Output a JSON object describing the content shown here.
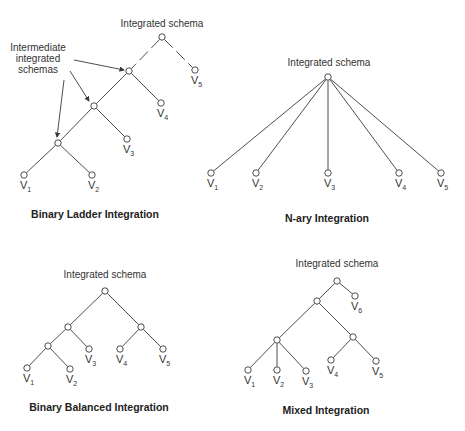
{
  "panels": [
    {
      "id": "binary-ladder",
      "title": "Binary Ladder Integration",
      "root_label": "Integrated schema",
      "annotation": [
        "Intermediate",
        "integrated",
        "schemas"
      ],
      "root_label_pos": [
        162,
        27
      ],
      "title_pos": [
        95,
        218
      ],
      "nodes": [
        {
          "id": "r",
          "x": 162,
          "y": 37
        },
        {
          "id": "i3",
          "x": 129,
          "y": 71
        },
        {
          "id": "i2",
          "x": 94,
          "y": 106
        },
        {
          "id": "i1",
          "x": 58,
          "y": 143
        },
        {
          "id": "v1",
          "x": 24,
          "y": 175,
          "label": "V",
          "sub": "1"
        },
        {
          "id": "v2",
          "x": 92,
          "y": 175,
          "label": "V",
          "sub": "2"
        },
        {
          "id": "v3",
          "x": 127,
          "y": 139,
          "label": "V",
          "sub": "3"
        },
        {
          "id": "v4",
          "x": 161,
          "y": 103,
          "label": "V",
          "sub": "4"
        },
        {
          "id": "v5",
          "x": 195,
          "y": 70,
          "label": "V",
          "sub": "5"
        }
      ],
      "edges": [
        [
          "r",
          "i3"
        ],
        [
          "r",
          "v5"
        ],
        [
          "i3",
          "i2"
        ],
        [
          "i3",
          "v4"
        ],
        [
          "i2",
          "i1"
        ],
        [
          "i2",
          "v3"
        ],
        [
          "i1",
          "v1"
        ],
        [
          "i1",
          "v2"
        ]
      ],
      "dashed_edges": [
        [
          "r",
          "i3"
        ],
        [
          "r",
          "v5"
        ]
      ],
      "arrows": [
        {
          "from": [
            74,
            60
          ],
          "to": [
            124,
            70
          ]
        },
        {
          "from": [
            70,
            71
          ],
          "to": [
            89,
            101
          ]
        },
        {
          "from": [
            64,
            80
          ],
          "to": [
            57,
            137
          ]
        }
      ]
    },
    {
      "id": "n-ary",
      "title": "N-ary Integration",
      "root_label": "Integrated schema",
      "root_label_pos": [
        329,
        66
      ],
      "title_pos": [
        327,
        222
      ],
      "nodes": [
        {
          "id": "r",
          "x": 328,
          "y": 77
        },
        {
          "id": "v1",
          "x": 211,
          "y": 173,
          "label": "V",
          "sub": "1"
        },
        {
          "id": "v2",
          "x": 256,
          "y": 173,
          "label": "V",
          "sub": "2"
        },
        {
          "id": "v3",
          "x": 328,
          "y": 173,
          "label": "V",
          "sub": "3"
        },
        {
          "id": "v4",
          "x": 399,
          "y": 173,
          "label": "V",
          "sub": "4"
        },
        {
          "id": "v5",
          "x": 441,
          "y": 173,
          "label": "V",
          "sub": "5"
        }
      ],
      "edges": [
        [
          "r",
          "v1"
        ],
        [
          "r",
          "v2"
        ],
        [
          "r",
          "v3"
        ],
        [
          "r",
          "v4"
        ],
        [
          "r",
          "v5"
        ]
      ]
    },
    {
      "id": "binary-balanced",
      "title": "Binary Balanced Integration",
      "root_label": "Integrated schema",
      "root_label_pos": [
        105,
        278
      ],
      "title_pos": [
        99,
        411
      ],
      "nodes": [
        {
          "id": "r",
          "x": 105,
          "y": 291
        },
        {
          "id": "a",
          "x": 68,
          "y": 327
        },
        {
          "id": "b",
          "x": 141,
          "y": 327
        },
        {
          "id": "c",
          "x": 48,
          "y": 346
        },
        {
          "id": "v1",
          "x": 27,
          "y": 368,
          "label": "V",
          "sub": "1"
        },
        {
          "id": "v2",
          "x": 70,
          "y": 369,
          "label": "V",
          "sub": "2"
        },
        {
          "id": "v3",
          "x": 89,
          "y": 349,
          "label": "V",
          "sub": "3"
        },
        {
          "id": "v4",
          "x": 120,
          "y": 349,
          "label": "V",
          "sub": "4"
        },
        {
          "id": "v5",
          "x": 163,
          "y": 349,
          "label": "V",
          "sub": "5"
        }
      ],
      "edges": [
        [
          "r",
          "a"
        ],
        [
          "r",
          "b"
        ],
        [
          "a",
          "c"
        ],
        [
          "a",
          "v3"
        ],
        [
          "c",
          "v1"
        ],
        [
          "c",
          "v2"
        ],
        [
          "b",
          "v4"
        ],
        [
          "b",
          "v5"
        ]
      ]
    },
    {
      "id": "mixed",
      "title": "Mixed Integration",
      "root_label": "Integrated schema",
      "root_label_pos": [
        337,
        267
      ],
      "title_pos": [
        326,
        414
      ],
      "nodes": [
        {
          "id": "r",
          "x": 337,
          "y": 281
        },
        {
          "id": "a",
          "x": 317,
          "y": 301
        },
        {
          "id": "b",
          "x": 277,
          "y": 340
        },
        {
          "id": "c",
          "x": 353,
          "y": 337
        },
        {
          "id": "v1",
          "x": 248,
          "y": 370,
          "label": "V",
          "sub": "1"
        },
        {
          "id": "v2",
          "x": 277,
          "y": 370,
          "label": "V",
          "sub": "2"
        },
        {
          "id": "v3",
          "x": 306,
          "y": 371,
          "label": "V",
          "sub": "3"
        },
        {
          "id": "v4",
          "x": 331,
          "y": 360,
          "label": "V",
          "sub": "4"
        },
        {
          "id": "v5",
          "x": 376,
          "y": 361,
          "label": "V",
          "sub": "5"
        },
        {
          "id": "v6",
          "x": 355,
          "y": 296,
          "label": "V",
          "sub": "6"
        }
      ],
      "edges": [
        [
          "r",
          "a"
        ],
        [
          "r",
          "v6"
        ],
        [
          "a",
          "b"
        ],
        [
          "a",
          "c"
        ],
        [
          "b",
          "v1"
        ],
        [
          "b",
          "v2"
        ],
        [
          "b",
          "v3"
        ],
        [
          "c",
          "v4"
        ],
        [
          "c",
          "v5"
        ]
      ]
    }
  ]
}
